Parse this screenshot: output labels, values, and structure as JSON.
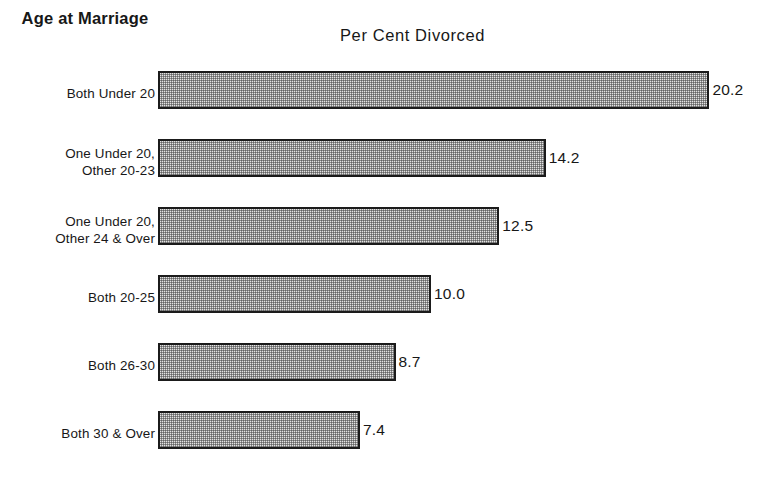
{
  "headers": {
    "category_header": "Age at\nMarriage",
    "value_header": "Per Cent Divorced"
  },
  "axis": {
    "origin_px": 158,
    "px_per_unit": 27.3
  },
  "chart_data": {
    "type": "bar",
    "orientation": "horizontal",
    "title": "Per Cent Divorced",
    "xlabel": "Per Cent Divorced",
    "ylabel": "Age at Marriage",
    "grid": false,
    "legend": null,
    "xlim": [
      0,
      20.2
    ],
    "categories": [
      "Both Under 20",
      "One Under 20,\nOther 20-23",
      "One Under 20,\nOther 24 & Over",
      "Both 20-25",
      "Both 26-30",
      "Both 30 & Over"
    ],
    "values": [
      20.2,
      14.2,
      12.5,
      10.0,
      8.7,
      7.4
    ],
    "value_labels": [
      "20.2",
      "14.2",
      "12.5",
      "10.0",
      "8.7",
      "7.4"
    ],
    "bar_fill": "#e3e3e3",
    "bar_edge": "#1b1b1b"
  },
  "rows": [
    {
      "label": "Both Under 20",
      "value": 20.2,
      "value_label": "20.2"
    },
    {
      "label": "One Under 20,\nOther 20-23",
      "value": 14.2,
      "value_label": "14.2"
    },
    {
      "label": "One Under 20,\nOther 24 & Over",
      "value": 12.5,
      "value_label": "12.5"
    },
    {
      "label": "Both 20-25",
      "value": 10.0,
      "value_label": "10.0"
    },
    {
      "label": "Both 26-30",
      "value": 8.7,
      "value_label": "8.7"
    },
    {
      "label": "Both 30 & Over",
      "value": 7.4,
      "value_label": "7.4"
    }
  ]
}
